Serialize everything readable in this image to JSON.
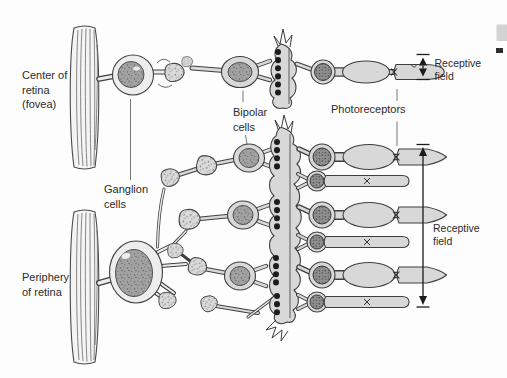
{
  "colors": {
    "background": "#fdfdfd",
    "cell_fill": "#d8d8d8",
    "cytoplasm_fill": "#ededed",
    "nucleus_fill": "#9e9e9e",
    "photoreceptor_nucleus_fill": "#8e8e8e",
    "outline": "#3f3f3f",
    "text": "#2b2b2b"
  },
  "labels": {
    "center_of_retina": [
      "Center of",
      "retina",
      "(fovea)"
    ],
    "periphery_of_retina": [
      "Periphery",
      "of retina"
    ],
    "ganglion_cells": [
      "Ganglion",
      "cells"
    ],
    "bipolar_cells": [
      "Bipolar",
      "cells"
    ],
    "photoreceptors": "Photoreceptors",
    "receptive_field_fovea": [
      "Receptive",
      "field"
    ],
    "receptive_field_periphery": [
      "Receptive",
      "field"
    ]
  }
}
